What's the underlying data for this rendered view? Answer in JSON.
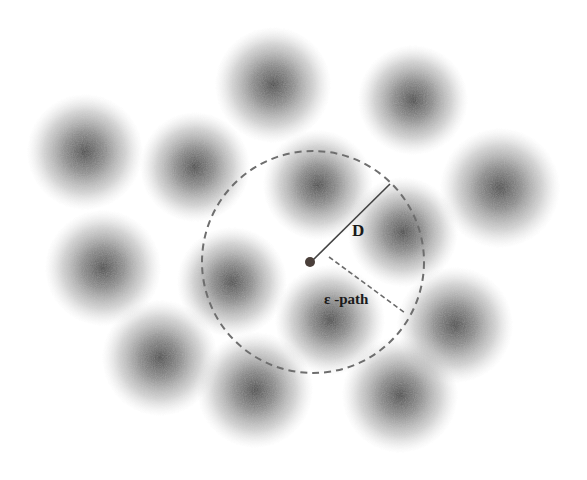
{
  "diagram": {
    "labels": {
      "distance": "D",
      "epsilon_path": "ε -path"
    },
    "colors": {
      "background": "#ffffff",
      "blob_core": "#3a3a3a",
      "dashed_circle": "#6e6e6e",
      "d_line": "#444444",
      "epsilon_line": "#6a6a6a",
      "center_dot": "#4a3f3a"
    },
    "center_point": {
      "x": 310,
      "y": 262,
      "r": 5
    },
    "search_circle": {
      "cx": 313,
      "cy": 262,
      "r": 111,
      "style": "dashed"
    },
    "d_line": {
      "x1": 313,
      "y1": 260,
      "x2": 390,
      "y2": 184
    },
    "epsilon_line": {
      "x1": 329,
      "y1": 257,
      "x2": 405,
      "y2": 313,
      "style": "dashed"
    },
    "blobs": [
      {
        "cx": 85,
        "cy": 152,
        "r": 58
      },
      {
        "cx": 195,
        "cy": 167,
        "r": 55
      },
      {
        "cx": 273,
        "cy": 85,
        "r": 58
      },
      {
        "cx": 413,
        "cy": 100,
        "r": 55
      },
      {
        "cx": 500,
        "cy": 188,
        "r": 60
      },
      {
        "cx": 318,
        "cy": 185,
        "r": 55
      },
      {
        "cx": 403,
        "cy": 232,
        "r": 55
      },
      {
        "cx": 103,
        "cy": 268,
        "r": 58
      },
      {
        "cx": 232,
        "cy": 282,
        "r": 55
      },
      {
        "cx": 160,
        "cy": 358,
        "r": 58
      },
      {
        "cx": 255,
        "cy": 390,
        "r": 58
      },
      {
        "cx": 330,
        "cy": 320,
        "r": 55
      },
      {
        "cx": 455,
        "cy": 325,
        "r": 58
      },
      {
        "cx": 400,
        "cy": 395,
        "r": 58
      }
    ]
  }
}
